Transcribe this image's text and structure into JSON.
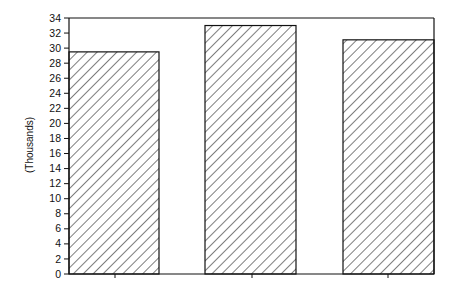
{
  "chart_data": {
    "type": "bar",
    "title": "",
    "xlabel": "",
    "ylabel": "(Thousands)",
    "categories": [
      "",
      "",
      ""
    ],
    "values": [
      29.5,
      33.0,
      31.1
    ],
    "ylim": [
      0,
      34
    ],
    "yticks": [
      0,
      2,
      4,
      6,
      8,
      10,
      12,
      14,
      16,
      18,
      20,
      22,
      24,
      26,
      28,
      30,
      32,
      34
    ],
    "grid": false,
    "legend": null,
    "bar_fill": "diagonal-hatch",
    "colors": {
      "line": "#111111",
      "background": "#ffffff"
    }
  }
}
